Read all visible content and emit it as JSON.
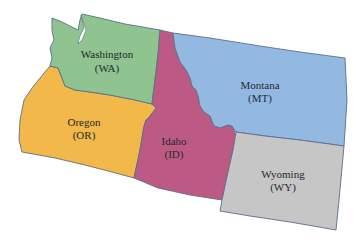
{
  "map": {
    "states": [
      {
        "name": "Washington",
        "abbr": "(WA)",
        "color": "#8fc38f",
        "label_x": 107,
        "label_y": 58,
        "abbr_y": 72
      },
      {
        "name": "Oregon",
        "abbr": "(OR)",
        "color": "#f2b84a",
        "label_x": 84,
        "label_y": 126,
        "abbr_y": 139
      },
      {
        "name": "Idaho",
        "abbr": "(ID)",
        "color": "#bc5a83",
        "label_x": 174,
        "label_y": 145,
        "abbr_y": 158
      },
      {
        "name": "Montana",
        "abbr": "(MT)",
        "color": "#93b9e3",
        "label_x": 260,
        "label_y": 89,
        "abbr_y": 102
      },
      {
        "name": "Wyoming",
        "abbr": "(WY)",
        "color": "#c6c6c6",
        "label_x": 283,
        "label_y": 178,
        "abbr_y": 191
      }
    ]
  }
}
